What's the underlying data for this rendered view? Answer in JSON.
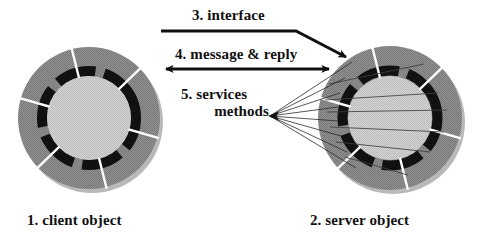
{
  "diagram": {
    "title_present": false,
    "background_color": "#ffffff",
    "labels": {
      "interface": "3. interface",
      "message_reply": "4. message & reply",
      "services": "5. services",
      "methods": "methods",
      "client_object": "1. client object",
      "server_object": "2. server object"
    },
    "colors": {
      "segment_gray": "#8c8c8c",
      "segment_gray_dark": "#7d7d7d",
      "inner_band_black": "#111111",
      "hub_gray": "#c8c8c8",
      "gap_white": "#ffffff",
      "line_black": "#101010",
      "shadow_gray": "#b8b8b8",
      "thin_line_gray": "#4a4a4a"
    },
    "objects": [
      {
        "name": "client object",
        "label_key": "client_object",
        "center_x": 89,
        "center_y": 118,
        "outer_radius": 71,
        "inner_band_outer_radius": 52,
        "hub_radius": 42,
        "segment_count": 6,
        "rotation_deg": -14,
        "has_method_lines": false
      },
      {
        "name": "server object",
        "label_key": "server_object",
        "center_x": 390,
        "center_y": 118,
        "outer_radius": 72,
        "inner_band_outer_radius": 53,
        "hub_radius": 42,
        "segment_count": 6,
        "rotation_deg": -14,
        "has_method_lines": true
      }
    ],
    "arrows": {
      "interface": {
        "label_key": "interface",
        "kind": "bent-single-head",
        "x1": 161,
        "y1": 31,
        "bend_x": 296,
        "bend_y": 31,
        "x2": 346,
        "y2": 57,
        "head_at": "end",
        "stroke_width": 3
      },
      "message_reply": {
        "label_key": "message_reply",
        "kind": "double-head",
        "x1": 160,
        "y1": 69,
        "x2": 334,
        "y2": 69,
        "head_at": "both",
        "stroke_width": 3
      },
      "services_methods": {
        "label_key": "services",
        "kind": "fan-single-head",
        "apex_x": 270,
        "apex_y": 116,
        "head_at": "apex",
        "line_count": 8,
        "stroke_width": 1,
        "fan_targets": [
          {
            "x": 352,
            "y": 62
          },
          {
            "x": 345,
            "y": 78
          },
          {
            "x": 340,
            "y": 93
          },
          {
            "x": 338,
            "y": 107
          },
          {
            "x": 338,
            "y": 121
          },
          {
            "x": 341,
            "y": 136
          },
          {
            "x": 347,
            "y": 152
          },
          {
            "x": 356,
            "y": 168
          }
        ]
      }
    },
    "server_internal_lines": [
      {
        "x1": 329,
        "y1": 84,
        "x2": 424,
        "y2": 64
      },
      {
        "x1": 325,
        "y1": 100,
        "x2": 438,
        "y2": 93
      },
      {
        "x1": 327,
        "y1": 112,
        "x2": 447,
        "y2": 110
      },
      {
        "x1": 330,
        "y1": 127,
        "x2": 444,
        "y2": 132
      },
      {
        "x1": 336,
        "y1": 142,
        "x2": 430,
        "y2": 152
      },
      {
        "x1": 345,
        "y1": 157,
        "x2": 408,
        "y2": 175
      }
    ]
  }
}
